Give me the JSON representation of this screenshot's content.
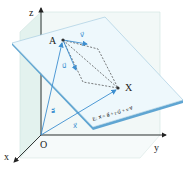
{
  "diagram": {
    "axes": {
      "x": "x",
      "y": "y",
      "z": "z",
      "origin": "O"
    },
    "points": {
      "A": "A",
      "X": "X"
    },
    "vectors": {
      "a": "a⃗",
      "x": "x⃗",
      "u": "u⃗",
      "v": "v⃗"
    },
    "equation": "E: x⃗ = a⃗ + r·u⃗ + s·v⃗",
    "colors": {
      "plane": "#eaf6fb",
      "plane_edge": "#6aaed6",
      "vector": "#3d8fd0",
      "axis": "#222222",
      "guide_plane": "#e3f2ee",
      "dashed": "#444444"
    }
  }
}
